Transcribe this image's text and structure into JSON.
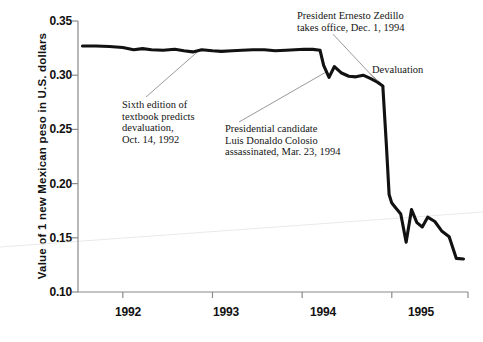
{
  "chart_data": {
    "type": "line",
    "title": "",
    "subtitle": "",
    "xlabel": "",
    "ylabel": "Value of 1 new Mexican peso in U.S. dollars",
    "xlim": [
      1991.5,
      1995.85
    ],
    "ylim": [
      0.1,
      0.35
    ],
    "grid": false,
    "legend": "none",
    "y_ticks": [
      "0.35",
      "0.30",
      "0.25",
      "0.20",
      "0.15",
      "0.10"
    ],
    "y_tick_values": [
      0.35,
      0.3,
      0.25,
      0.2,
      0.15,
      0.1
    ],
    "x_ticks": [
      "1992",
      "1993",
      "1994",
      "1995"
    ],
    "x_tick_values": [
      1992,
      1993,
      1994,
      1995
    ],
    "series": [
      {
        "name": "New Mexican peso in U.S. dollars",
        "color": "#111111",
        "x": [
          1991.55,
          1991.7,
          1991.85,
          1992.0,
          1992.12,
          1992.22,
          1992.32,
          1992.45,
          1992.58,
          1992.68,
          1992.78,
          1992.88,
          1993.0,
          1993.1,
          1993.22,
          1993.33,
          1993.45,
          1993.58,
          1993.7,
          1993.82,
          1993.92,
          1994.02,
          1994.12,
          1994.2,
          1994.24,
          1994.3,
          1994.36,
          1994.44,
          1994.52,
          1994.6,
          1994.68,
          1994.76,
          1994.84,
          1994.9,
          1994.94,
          1994.97,
          1995.0,
          1995.04,
          1995.1,
          1995.16,
          1995.22,
          1995.28,
          1995.34,
          1995.4,
          1995.48,
          1995.56,
          1995.64,
          1995.72,
          1995.8
        ],
        "y": [
          0.327,
          0.327,
          0.3265,
          0.3255,
          0.3235,
          0.3245,
          0.3235,
          0.323,
          0.324,
          0.3225,
          0.3215,
          0.3235,
          0.3225,
          0.322,
          0.3225,
          0.323,
          0.3235,
          0.3235,
          0.3225,
          0.323,
          0.3235,
          0.324,
          0.3238,
          0.323,
          0.309,
          0.298,
          0.308,
          0.302,
          0.299,
          0.2985,
          0.3,
          0.297,
          0.2935,
          0.29,
          0.235,
          0.19,
          0.182,
          0.178,
          0.172,
          0.146,
          0.176,
          0.164,
          0.16,
          0.169,
          0.165,
          0.156,
          0.151,
          0.131,
          0.1305
        ]
      }
    ],
    "annotations": [
      {
        "id": "textbook",
        "lines": [
          "Sixth edition of",
          "textbook predicts",
          "devaluation,",
          "Oct. 14, 1992"
        ],
        "point": [
          1992.85,
          0.3228
        ],
        "label_pos": [
          122,
          99
        ]
      },
      {
        "id": "colosio",
        "lines": [
          "Presidential candidate",
          "Luis Donaldo Colosio",
          "assassinated, Mar. 23, 1994"
        ],
        "point": [
          1994.27,
          0.303
        ],
        "label_pos": [
          225,
          123
        ]
      },
      {
        "id": "zedillo",
        "lines": [
          "President Ernesto Zedillo",
          "takes office, Dec. 1, 1994"
        ],
        "point": [
          1994.87,
          0.2915
        ],
        "label_pos": [
          297,
          10
        ]
      },
      {
        "id": "devaluation",
        "lines": [
          "Devaluation"
        ],
        "point": [
          1994.92,
          0.2895
        ],
        "label_pos": [
          372,
          64
        ]
      }
    ]
  },
  "axis": {
    "y_title": "Value of 1 new Mexican peso in U.S. dollars"
  }
}
